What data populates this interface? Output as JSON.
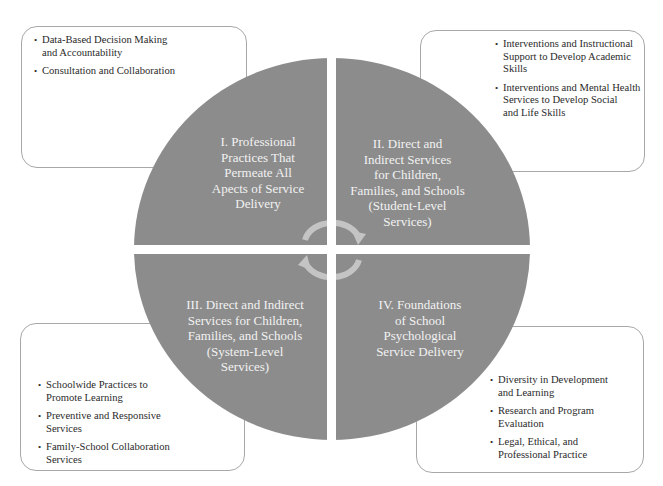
{
  "diagram": {
    "type": "quadrant-circle",
    "colors": {
      "circle_fill": "#8c8c8c",
      "quadrant_text": "#f2f2f2",
      "arrow": "#c4c4c4",
      "box_border": "#a8a8a8",
      "box_text": "#2a2a2a",
      "background": "#ffffff"
    },
    "quadrants": [
      {
        "id": "I",
        "label": "I. Professional Practices That Permeate All Apects of Service Delivery",
        "lines": [
          "I.  Professional",
          "Practices That",
          "Permeate All",
          "Apects of Service",
          "Delivery"
        ]
      },
      {
        "id": "II",
        "label": "II. Direct and Indirect Services for Children, Families, and Schools (Student-Level Services)",
        "lines": [
          "II.  Direct and",
          "Indirect Services",
          "for Children,",
          "Families, and Schools",
          "(Student-Level",
          "Services)"
        ]
      },
      {
        "id": "III",
        "label": "III. Direct and Indirect Services for Children, Families, and Schools (System-Level Services)",
        "lines": [
          "III. Direct and Indirect",
          "Services for Children,",
          "Families, and Schools",
          "(System-Level",
          "Services)"
        ]
      },
      {
        "id": "IV",
        "label": "IV. Foundations of School Psychological Service Delivery",
        "lines": [
          "IV. Foundations",
          "of School",
          "Psychological",
          "Service Delivery"
        ]
      }
    ],
    "center_icons": [
      "cycle-arrow-clockwise-top",
      "cycle-arrow-clockwise-bottom"
    ]
  },
  "boxes": {
    "top_left": {
      "items": [
        {
          "lines": [
            "Data-Based Decision Making",
            "and Accountability"
          ]
        },
        {
          "lines": [
            "Consultation and Collaboration"
          ]
        }
      ]
    },
    "top_right": {
      "items": [
        {
          "lines": [
            "Interventions and Instructional",
            "Support to Develop Academic",
            "Skills"
          ]
        },
        {
          "lines": [
            "Interventions and Mental Health",
            "Services to Develop Social",
            "and Life Skills"
          ]
        }
      ]
    },
    "bottom_left": {
      "items": [
        {
          "lines": [
            "Schoolwide Practices to",
            "Promote Learning"
          ]
        },
        {
          "lines": [
            "Preventive and Responsive",
            "Services"
          ]
        },
        {
          "lines": [
            "Family-School Collaboration",
            "Services"
          ]
        }
      ]
    },
    "bottom_right": {
      "items": [
        {
          "lines": [
            "Diversity in Development",
            "and Learning"
          ]
        },
        {
          "lines": [
            "Research and Program",
            "Evaluation"
          ]
        },
        {
          "lines": [
            "Legal, Ethical, and",
            "Professional Practice"
          ]
        }
      ]
    }
  }
}
